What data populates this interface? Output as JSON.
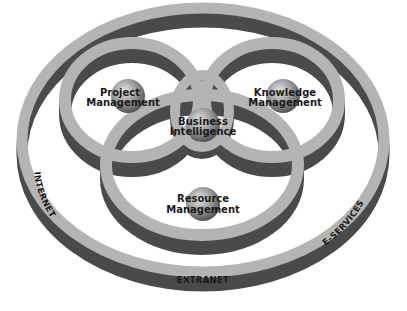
{
  "diagram": {
    "type": "nested-venn-rings",
    "outer_ring": {
      "labels": {
        "left": "INTERNET",
        "bottom": "EXTRANET",
        "right": "E-SERVICES"
      }
    },
    "inner_rings": [
      {
        "id": "project",
        "line1": "Project",
        "line2": "Management"
      },
      {
        "id": "knowledge",
        "line1": "Knowledge",
        "line2": "Management"
      },
      {
        "id": "resource",
        "line1": "Resource",
        "line2": "Management"
      }
    ],
    "center": {
      "line1": "Business",
      "line2": "Intelligence"
    },
    "colors": {
      "face": "#b4b4b4",
      "side": "#4a4a4a",
      "text": "#1a1a1a",
      "sphere_light": "#d8d8d8",
      "sphere_dark": "#6a6a6a",
      "background": "#ffffff"
    }
  }
}
